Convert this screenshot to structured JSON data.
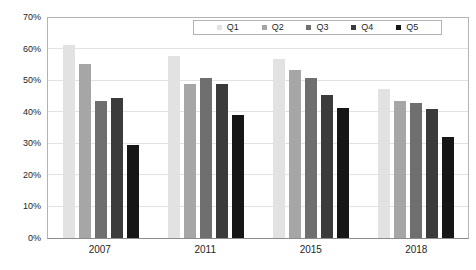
{
  "chart_data": {
    "type": "bar",
    "title": "",
    "xlabel": "",
    "ylabel": "",
    "categories": [
      "2007",
      "2011",
      "2015",
      "2018"
    ],
    "series": [
      {
        "name": "Q1",
        "color": "#e2e2e2",
        "values": [
          61.5,
          58,
          57,
          47.5
        ]
      },
      {
        "name": "Q2",
        "color": "#a6a6a6",
        "values": [
          55.5,
          49,
          53.5,
          43.5
        ]
      },
      {
        "name": "Q3",
        "color": "#6f6f6f",
        "values": [
          43.5,
          51,
          51,
          43
        ]
      },
      {
        "name": "Q4",
        "color": "#3b3b3b",
        "values": [
          44.5,
          49,
          45.5,
          41
        ]
      },
      {
        "name": "Q5",
        "color": "#161616",
        "values": [
          29.5,
          39,
          41.5,
          32
        ]
      }
    ],
    "ylim": [
      0,
      70
    ],
    "ytick_step": 10,
    "ytick_labels": [
      "0%",
      "10%",
      "20%",
      "30%",
      "40%",
      "50%",
      "60%",
      "70%"
    ],
    "grid": true,
    "legend": {
      "position": "top-right-inside",
      "orientation": "horizontal",
      "boxed": true,
      "entries": [
        "Q1",
        "Q2",
        "Q3",
        "Q4",
        "Q5"
      ]
    }
  },
  "colors": {
    "background": "#ffffff",
    "plot_border": "#b3b3b3",
    "axis_line": "#8c8c8c",
    "gridline": "#e3e3e3",
    "tick_text": "#262626"
  }
}
